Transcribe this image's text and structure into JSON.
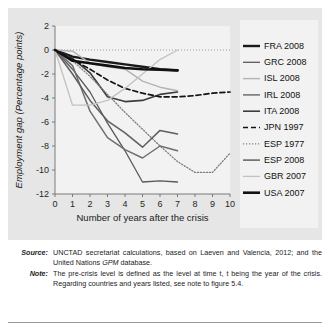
{
  "figure": {
    "panel_bg": "#e6e6e6",
    "plot_bg": "#f2f2f2",
    "legend_bg": "#f2f2f2"
  },
  "caption": {
    "source_key": "Source:",
    "source_text": "UNCTAD secretariat calculations, based on Laeven and Valencia, 2012; and the United Nations GPM database.",
    "source_text_a": "UNCTAD secretariat calculations, based on Laeven and Valencia, 2012; and the United Nations ",
    "source_italic": "GPM",
    "source_text_b": " database.",
    "note_key": "Note:",
    "note_text": "The pre-crisis level is defined as the level at time t, t being the year of the crisis. Regarding countries and years listed, see note to figure 5.4."
  },
  "chart_data": {
    "type": "line",
    "title": "",
    "xlabel": "Number of years after the crisis",
    "ylabel": "Employment gap (Percentage points)",
    "xlim": [
      0,
      10
    ],
    "ylim": [
      -12,
      2
    ],
    "xticks": [
      0,
      1,
      2,
      3,
      4,
      5,
      6,
      7,
      8,
      9,
      10
    ],
    "yticks": [
      2,
      0,
      -2,
      -4,
      -6,
      -8,
      -10,
      -12
    ],
    "xticklabels": [
      "0",
      "1",
      "2",
      "3",
      "4",
      "5",
      "6",
      "7",
      "8",
      "9",
      "10"
    ],
    "yticklabels": [
      "2",
      "0",
      "-2",
      "-4",
      "-6",
      "-8",
      "-10",
      "-12"
    ],
    "grid": false,
    "zero_reference_line": 0,
    "legend_position": "right",
    "series": [
      {
        "name": "FRA 2008",
        "color": "#1a1a1a",
        "width": 2.4,
        "dash": "none",
        "x": [
          0,
          1,
          2,
          3,
          4,
          5,
          6,
          7
        ],
        "values": [
          0,
          -0.55,
          -0.8,
          -1.0,
          -1.2,
          -1.4,
          -1.6,
          -1.7
        ]
      },
      {
        "name": "GRC 2008",
        "color": "#5a5a5a",
        "width": 1.3,
        "dash": "none",
        "x": [
          0,
          1,
          2,
          3,
          4,
          5,
          6,
          7
        ],
        "values": [
          0,
          -1.6,
          -3.5,
          -6.1,
          -8.4,
          -11.0,
          -10.9,
          -11.0
        ]
      },
      {
        "name": "ISL 2008",
        "color": "#b3b3b3",
        "width": 1.4,
        "dash": "none",
        "x": [
          0,
          1,
          2,
          3,
          4,
          5,
          6,
          7
        ],
        "values": [
          0,
          -0.1,
          -1.1,
          -1.4,
          -1.6,
          -2.6,
          -3.1,
          -3.4
        ]
      },
      {
        "name": "IRL 2008",
        "color": "#6e6e6e",
        "width": 1.5,
        "dash": "none",
        "x": [
          0,
          1,
          2,
          3,
          4,
          5,
          6,
          7
        ],
        "values": [
          0,
          -1.3,
          -5.1,
          -7.3,
          -8.3,
          -9.0,
          -8.0,
          -8.4
        ]
      },
      {
        "name": "ITA 2008",
        "color": "#3d3d3d",
        "width": 1.6,
        "dash": "none",
        "x": [
          0,
          1,
          2,
          3,
          4,
          5,
          6,
          7
        ],
        "values": [
          0,
          -0.7,
          -1.9,
          -3.9,
          -4.3,
          -4.2,
          -3.7,
          -3.5
        ]
      },
      {
        "name": "JPN 1997",
        "color": "#141414",
        "width": 1.7,
        "dash": "5,3",
        "x": [
          0,
          1,
          2,
          3,
          4,
          5,
          6,
          7,
          8,
          9,
          10
        ],
        "values": [
          0,
          -0.8,
          -1.6,
          -2.5,
          -3.2,
          -3.6,
          -3.9,
          -3.9,
          -3.8,
          -3.6,
          -3.5
        ]
      },
      {
        "name": "ESP 1977",
        "color": "#7d7d7d",
        "width": 1.3,
        "dash": "1.2,1.8",
        "x": [
          0,
          1,
          2,
          3,
          4,
          5,
          6,
          7,
          8,
          9,
          10
        ],
        "values": [
          0,
          -0.9,
          -2.2,
          -3.7,
          -5.2,
          -6.6,
          -8.0,
          -9.3,
          -10.2,
          -10.2,
          -8.6
        ]
      },
      {
        "name": "ESP 2008",
        "color": "#5f5f5f",
        "width": 1.5,
        "dash": "none",
        "x": [
          0,
          1,
          2,
          3,
          4,
          5,
          6,
          7
        ],
        "values": [
          0,
          -2.0,
          -4.2,
          -5.9,
          -6.9,
          -8.1,
          -6.7,
          -7.0
        ]
      },
      {
        "name": "GBR 2007",
        "color": "#c2c2c2",
        "width": 1.3,
        "dash": "none",
        "x": [
          0,
          1,
          2,
          3,
          4,
          5,
          6,
          7
        ],
        "values": [
          0,
          -4.6,
          -4.6,
          -4.2,
          -3.2,
          -2.0,
          -0.8,
          0.0
        ]
      },
      {
        "name": "USA 2007",
        "color": "#111111",
        "width": 2.6,
        "dash": "none",
        "x": [
          0,
          1,
          2,
          3,
          4,
          5,
          6,
          7
        ],
        "values": [
          0,
          -0.9,
          -1.1,
          -1.3,
          -1.5,
          -1.6,
          -1.65,
          -1.7
        ]
      }
    ]
  }
}
